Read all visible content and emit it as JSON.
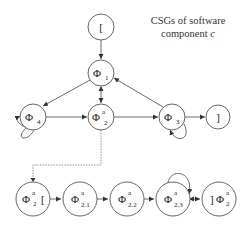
{
  "title": {
    "line1": "CSGs of software",
    "line2": "component ",
    "line2_italic": "c"
  },
  "nodes": {
    "start": {
      "label": "[",
      "cx": 101,
      "cy": 27,
      "r": 13
    },
    "phi1": {
      "label": "Φ",
      "sub": "1",
      "sup": "",
      "cx": 101,
      "cy": 73,
      "r": 13
    },
    "phi4": {
      "label": "Φ",
      "sub": "4",
      "sup": "",
      "cx": 33,
      "cy": 117,
      "r": 13
    },
    "phi2": {
      "label": "Φ",
      "sub": "2",
      "sup": "a",
      "cx": 101,
      "cy": 117,
      "r": 13
    },
    "phi3": {
      "label": "Φ",
      "sub": "3",
      "sup": "",
      "cx": 172,
      "cy": 117,
      "r": 13
    },
    "end": {
      "label": "]",
      "cx": 218,
      "cy": 117,
      "r": 12
    },
    "phi2_start": {
      "label": "Φ",
      "sub": "2",
      "sup": "a",
      "suffix": "[",
      "cx": 33,
      "cy": 199,
      "r": 17
    },
    "phi21": {
      "label": "Φ",
      "sub": "2.1",
      "sup": "a",
      "cx": 80,
      "cy": 199,
      "r": 17
    },
    "phi22": {
      "label": "Φ",
      "sub": "2.2",
      "sup": "a",
      "cx": 127,
      "cy": 199,
      "r": 17
    },
    "phi23": {
      "label": "Φ",
      "sub": "2.3",
      "sup": "a",
      "cx": 173,
      "cy": 199,
      "r": 17
    },
    "phi2_end": {
      "label": "Φ",
      "sub": "2",
      "sup": "a",
      "prefix": "]",
      "cx": 219,
      "cy": 199,
      "r": 17
    }
  },
  "edges": [
    {
      "from": "start",
      "to": "phi1"
    },
    {
      "from": "phi1",
      "to": "phi4"
    },
    {
      "from": "phi1",
      "to": "phi2",
      "bidirectional": true
    },
    {
      "from": "phi3",
      "to": "phi1"
    },
    {
      "from": "phi4",
      "to": "phi2"
    },
    {
      "from": "phi2",
      "to": "phi3"
    },
    {
      "from": "phi3",
      "to": "end"
    },
    {
      "from": "phi4",
      "to": "phi4",
      "self_loop": true
    },
    {
      "from": "phi3",
      "to": "phi3",
      "self_loop": true
    },
    {
      "from": "phi2",
      "to": "phi2_start",
      "style": "dashed",
      "meaning": "refinement"
    },
    {
      "from": "phi2_start",
      "to": "phi21"
    },
    {
      "from": "phi21",
      "to": "phi22"
    },
    {
      "from": "phi22",
      "to": "phi23"
    },
    {
      "from": "phi23",
      "to": "phi23",
      "self_loop": true
    },
    {
      "from": "phi23",
      "to": "phi2_end",
      "bidirectional": true
    }
  ],
  "colors": {
    "stroke": "#555555",
    "edge": "#444444",
    "text": "#222222",
    "background": "#ffffff"
  }
}
